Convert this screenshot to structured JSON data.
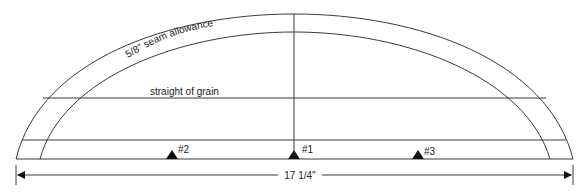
{
  "diagram": {
    "type": "sewing-pattern-piece",
    "labels": {
      "seam_allowance": "5/8\" seam allowance",
      "grain": "straight of grain",
      "width": "17 1/4\""
    },
    "notches": [
      {
        "id": "notch-2",
        "label": "#2",
        "x": 172
      },
      {
        "id": "notch-1",
        "label": "#1",
        "x": 294
      },
      {
        "id": "notch-3",
        "label": "#3",
        "x": 418
      }
    ],
    "colors": {
      "line": "#3a3a3a",
      "text": "#222222",
      "background": "#ffffff"
    }
  }
}
